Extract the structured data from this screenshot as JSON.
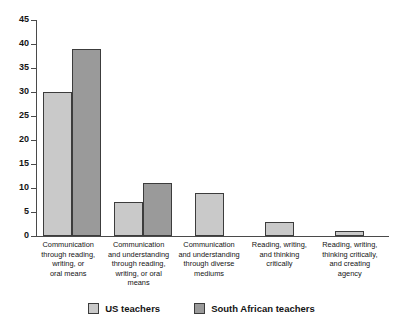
{
  "chart_data": {
    "type": "bar",
    "title": "",
    "xlabel": "",
    "ylabel": "",
    "ylim": [
      0,
      45
    ],
    "ytick_step": 5,
    "yticks": [
      0,
      5,
      10,
      15,
      20,
      25,
      30,
      35,
      40,
      45
    ],
    "grid": false,
    "legend_position": "bottom",
    "categories": [
      "Communication through reading, writing, or oral means",
      "Communication and understanding through reading, writing, or oral means",
      "Communication and understanding through diverse mediums",
      "Reading, writing, and thinking critically",
      "Reading, writing, thinking critically, and creating agency"
    ],
    "category_lines": [
      [
        "Communication",
        "through reading,",
        "writing, or",
        "oral means"
      ],
      [
        "Communication",
        "and understanding",
        "through reading,",
        "writing, or oral",
        "means"
      ],
      [
        "Communication",
        "and understanding",
        "through diverse",
        "mediums"
      ],
      [
        "Reading, writing,",
        "and thinking",
        "critically"
      ],
      [
        "Reading, writing,",
        "thinking critically,",
        "and creating",
        "agency"
      ]
    ],
    "series": [
      {
        "name": "US teachers",
        "color": "#c9c9c9",
        "values": [
          30,
          7,
          9,
          3,
          1
        ]
      },
      {
        "name": "South African teachers",
        "color": "#9a9a9a",
        "values": [
          39,
          11,
          null,
          null,
          null
        ]
      }
    ]
  },
  "legend": {
    "items": [
      {
        "label": "US teachers",
        "swatch": "us"
      },
      {
        "label": "South African teachers",
        "swatch": "sa"
      }
    ]
  }
}
